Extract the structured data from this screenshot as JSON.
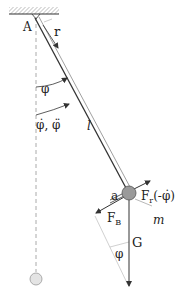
{
  "diagram": {
    "labels": {
      "pivot": "A",
      "r": "r",
      "phi": "φ",
      "phi_dot_ddot": "φ̇, φ̈",
      "length": "l",
      "a": "a",
      "friction_force": "F",
      "friction_sub": "r",
      "friction_arg": "(-φ̇)",
      "mass": "m",
      "inertial_force": "F",
      "inertial_sub": "B",
      "gravity": "G",
      "phi_lower": "φ"
    },
    "colors": {
      "stroke": "#333333",
      "bob_fill": "#9a9a9a",
      "bob_rest_fill": "#e0e0e0",
      "dashed": "#aaaaaa",
      "construction": "#bbbbbb"
    }
  }
}
